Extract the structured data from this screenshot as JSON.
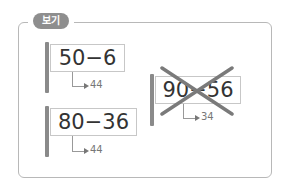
{
  "label": "보기",
  "items": [
    {
      "expression": "50−6",
      "answer": "44",
      "crossed": false
    },
    {
      "expression": "80−36",
      "answer": "44",
      "crossed": false
    },
    {
      "expression": "90−56",
      "answer": "34",
      "crossed": true
    }
  ]
}
